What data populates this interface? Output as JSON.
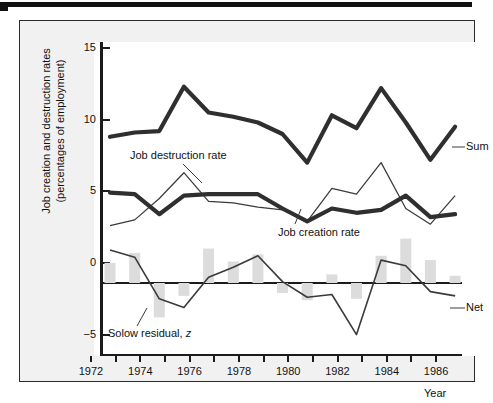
{
  "figure": {
    "y_axis_label_line1": "Job creation and destruction rates",
    "y_axis_label_line2": "(percentages of employment)",
    "x_axis_label": "Year"
  },
  "annotations": {
    "job_destruction": "Job destruction rate",
    "job_creation": "Job creation rate",
    "sum": "Sum",
    "net": "Net",
    "solow_residual": "Solow residual, z"
  },
  "chart_data": {
    "type": "line",
    "title": "",
    "xlabel": "Year",
    "ylabel": "Job creation and destruction rates (percentages of employment)",
    "xlim": [
      1972,
      1986
    ],
    "ylim": [
      -5,
      16.5
    ],
    "yticks": [
      15,
      10,
      5,
      0,
      -5
    ],
    "ytick_labels": [
      "15",
      "10",
      "5",
      "0",
      "−5"
    ],
    "xticks": [
      1972,
      1973,
      1974,
      1975,
      1976,
      1977,
      1978,
      1979,
      1980,
      1981,
      1982,
      1983,
      1984,
      1985,
      1986
    ],
    "xtick_labels_shown": [
      "1972",
      "1974",
      "1976",
      "1978",
      "1980",
      "1982",
      "1984",
      "1986"
    ],
    "grid": false,
    "legend": "inline-annotations",
    "x": [
      1972,
      1973,
      1974,
      1975,
      1976,
      1977,
      1978,
      1979,
      1980,
      1981,
      1982,
      1983,
      1984,
      1985,
      1986
    ],
    "series": [
      {
        "name": "Sum",
        "style": "thick-line",
        "color": "#2f2f2f",
        "values": [
          10.2,
          10.5,
          10.6,
          13.7,
          11.9,
          11.6,
          11.2,
          10.4,
          8.4,
          11.7,
          10.8,
          13.6,
          11.2,
          8.6,
          10.9
        ]
      },
      {
        "name": "Job creation rate",
        "style": "thick-line",
        "color": "#2f2f2f",
        "values": [
          6.3,
          6.2,
          4.8,
          6.1,
          6.2,
          6.2,
          6.2,
          5.2,
          4.3,
          5.2,
          4.9,
          5.1,
          6.1,
          4.6,
          4.8
        ]
      },
      {
        "name": "Job destruction rate",
        "style": "thin-line",
        "color": "#3a3a3a",
        "values": [
          4.0,
          4.4,
          5.9,
          7.7,
          5.7,
          5.6,
          5.3,
          5.1,
          4.3,
          6.6,
          6.2,
          8.4,
          5.2,
          4.1,
          6.1
        ]
      },
      {
        "name": "Net",
        "style": "thin-line",
        "color": "#3a3a3a",
        "values": [
          2.3,
          1.8,
          -1.1,
          -1.7,
          0.4,
          1.1,
          1.9,
          0.1,
          -1.0,
          -0.8,
          -3.6,
          1.6,
          1.2,
          -0.6,
          -0.9
        ]
      },
      {
        "name": "Solow residual, z",
        "style": "bar",
        "color": "#dcdcdc",
        "values": [
          1.4,
          2.1,
          -2.4,
          -0.9,
          2.4,
          1.5,
          2.0,
          -0.7,
          -1.2,
          0.6,
          -1.1,
          1.9,
          3.1,
          1.6,
          0.5
        ]
      }
    ]
  },
  "yticks_render": [
    {
      "label": "15",
      "value": 15
    },
    {
      "label": "10",
      "value": 10
    },
    {
      "label": "5",
      "value": 5
    },
    {
      "label": "0",
      "value": 0
    },
    {
      "label": "−5",
      "value": -5
    }
  ],
  "xticks_render": [
    {
      "label": "1972",
      "value": 1972
    },
    {
      "label": "1974",
      "value": 1974
    },
    {
      "label": "1976",
      "value": 1976
    },
    {
      "label": "1978",
      "value": 1978
    },
    {
      "label": "1980",
      "value": 1980
    },
    {
      "label": "1982",
      "value": 1982
    },
    {
      "label": "1984",
      "value": 1984
    },
    {
      "label": "1986",
      "value": 1986
    }
  ]
}
